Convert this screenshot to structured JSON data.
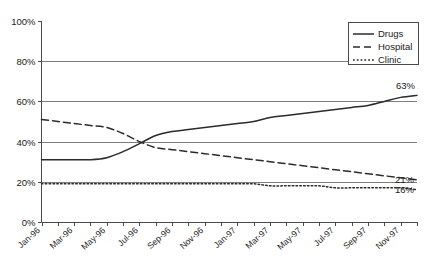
{
  "chart_data": {
    "type": "line",
    "title": "",
    "xlabel": "",
    "ylabel": "",
    "ylim": [
      0,
      100
    ],
    "ytick_labels": [
      "0%",
      "20%",
      "40%",
      "60%",
      "80%",
      "100%"
    ],
    "ytick_values": [
      0,
      20,
      40,
      60,
      80,
      100
    ],
    "grid": "horizontal",
    "legend_position": "top-right",
    "x": [
      "Jan-96",
      "Feb-96",
      "Mar-96",
      "Apr-96",
      "May-96",
      "Jun-96",
      "Jul-96",
      "Aug-96",
      "Sep-96",
      "Oct-96",
      "Nov-96",
      "Dec-96",
      "Jan-97",
      "Feb-97",
      "Mar-97",
      "Apr-97",
      "May-97",
      "Jun-97",
      "Jul-97",
      "Aug-97",
      "Sep-97",
      "Oct-97",
      "Nov-97",
      "Dec-97"
    ],
    "xtick_labels": [
      "Jan-96",
      "Mar-96",
      "May-96",
      "Jul-96",
      "Sep-96",
      "Nov-96",
      "Jan-97",
      "Mar-97",
      "May-97",
      "Jul-97",
      "Sep-97",
      "Nov-97"
    ],
    "series": [
      {
        "name": "Drugs",
        "style": "solid",
        "end_label": "63%",
        "values": [
          31,
          31,
          31,
          31,
          32,
          35,
          39,
          43,
          45,
          46,
          47,
          48,
          49,
          50,
          52,
          53,
          54,
          55,
          56,
          57,
          58,
          60,
          62,
          63
        ]
      },
      {
        "name": "Hospital",
        "style": "dashed",
        "end_label": "21%",
        "values": [
          51,
          50,
          49,
          48,
          47,
          44,
          40,
          37,
          36,
          35,
          34,
          33,
          32,
          31,
          30,
          29,
          28,
          27,
          26,
          25,
          24,
          23,
          22,
          21
        ]
      },
      {
        "name": "Clinic",
        "style": "dotted",
        "end_label": "16%",
        "values": [
          19,
          19,
          19,
          19,
          19,
          19,
          19,
          19,
          19,
          19,
          19,
          19,
          19,
          19,
          18,
          18,
          18,
          18,
          17,
          17,
          17,
          17,
          17,
          16
        ]
      }
    ]
  },
  "legend": {
    "items": [
      {
        "label": "Drugs"
      },
      {
        "label": "Hospital"
      },
      {
        "label": "Clinic"
      }
    ]
  },
  "colors": {
    "line": "#2b2b2b",
    "axis": "#4a4a4a",
    "grid": "#6e6e6e",
    "background": "#ffffff"
  }
}
